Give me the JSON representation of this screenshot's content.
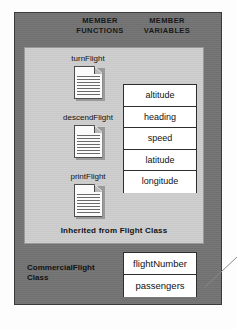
{
  "diagram": {
    "colors": {
      "outer_frame": "#737373",
      "inner_panel": "#cdcdcd",
      "box_fill": "#ffffff",
      "box_border": "#2e2e2e",
      "text": "#111214",
      "page_background": "#fdfdfd"
    }
  },
  "headings": {
    "member_functions_line1": "MEMBER",
    "member_functions_line2": "FUNCTIONS",
    "member_variables_line1": "MEMBER",
    "member_variables_line2": "VARIABLES"
  },
  "member_functions": [
    {
      "label": "turnFlight",
      "icon": "document-icon"
    },
    {
      "label": "descendFlight",
      "icon": "document-icon"
    },
    {
      "label": "printFlight",
      "icon": "document-icon"
    }
  ],
  "inherited_member_variables": [
    {
      "label": "altitude"
    },
    {
      "label": "heading"
    },
    {
      "label": "speed"
    },
    {
      "label": "latitude"
    },
    {
      "label": "longitude"
    }
  ],
  "inherited_caption": "Inherited from Flight Class",
  "subclass": {
    "label_line1": "CommercialFlight",
    "label_line2": "Class",
    "member_variables": [
      {
        "label": "flightNumber"
      },
      {
        "label": "passengers"
      }
    ]
  }
}
